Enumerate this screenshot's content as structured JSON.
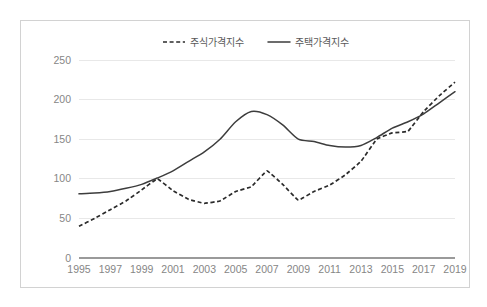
{
  "chart_data": {
    "type": "line",
    "title": "",
    "xlabel": "",
    "ylabel": "",
    "ylim": [
      0,
      250
    ],
    "yticks": [
      "0",
      "50",
      "100",
      "150",
      "200",
      "250"
    ],
    "grid": true,
    "legend_position": "top-center",
    "x": [
      1995,
      1996,
      1997,
      1998,
      1999,
      2000,
      2001,
      2002,
      2003,
      2004,
      2005,
      2006,
      2007,
      2008,
      2009,
      2010,
      2011,
      2012,
      2013,
      2014,
      2015,
      2016,
      2017,
      2018,
      2019
    ],
    "xtick_labels": [
      "1995",
      "1997",
      "1999",
      "2001",
      "2003",
      "2005",
      "2007",
      "2009",
      "2011",
      "2013",
      "2015",
      "2017",
      "2019"
    ],
    "series": [
      {
        "name": "주식가격지수",
        "style": "dashed",
        "color": "#2b2b2b",
        "values": [
          40,
          50,
          61,
          72,
          86,
          100,
          85,
          74,
          69,
          72,
          84,
          90,
          110,
          93,
          73,
          84,
          92,
          105,
          122,
          150,
          158,
          160,
          185,
          205,
          222
        ]
      },
      {
        "name": "주택가격지수",
        "style": "solid",
        "color": "#3d3d3d",
        "values": [
          81,
          82,
          84,
          88,
          93,
          101,
          110,
          122,
          134,
          150,
          172,
          185,
          181,
          168,
          150,
          147,
          142,
          140,
          142,
          152,
          164,
          172,
          182,
          196,
          210
        ]
      }
    ]
  },
  "legend": {
    "items": [
      {
        "label": "주식가격지수",
        "style": "dashed"
      },
      {
        "label": "주택가격지수",
        "style": "solid"
      }
    ]
  }
}
